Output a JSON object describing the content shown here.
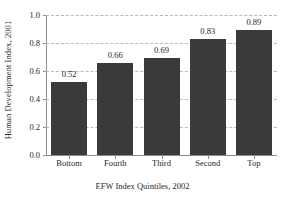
{
  "chart_data": {
    "type": "bar",
    "title": "",
    "xlabel": "EFW Index Quintiles, 2002",
    "ylabel": "Human Development Index, 2001",
    "categories": [
      "Bottom",
      "Fourth",
      "Third",
      "Second",
      "Top"
    ],
    "values": [
      0.52,
      0.66,
      0.69,
      0.83,
      0.89
    ],
    "value_labels": [
      "0.52",
      "0.66",
      "0.69",
      "0.83",
      "0.89"
    ],
    "ylim": [
      0.0,
      1.0
    ],
    "ytick_labels": [
      "1.0",
      "0.8",
      "0.6",
      "0.4",
      "0.2",
      "0.0"
    ],
    "ytick_values": [
      1.0,
      0.8,
      0.6,
      0.4,
      0.2,
      0.0
    ],
    "grid": true,
    "grid_style": "dashed",
    "legend": "none",
    "bar_color": "#3a3a3a",
    "grid_color": "#b9b9b9",
    "axis_color": "#8d8d8d",
    "background_color": "#ffffff"
  }
}
